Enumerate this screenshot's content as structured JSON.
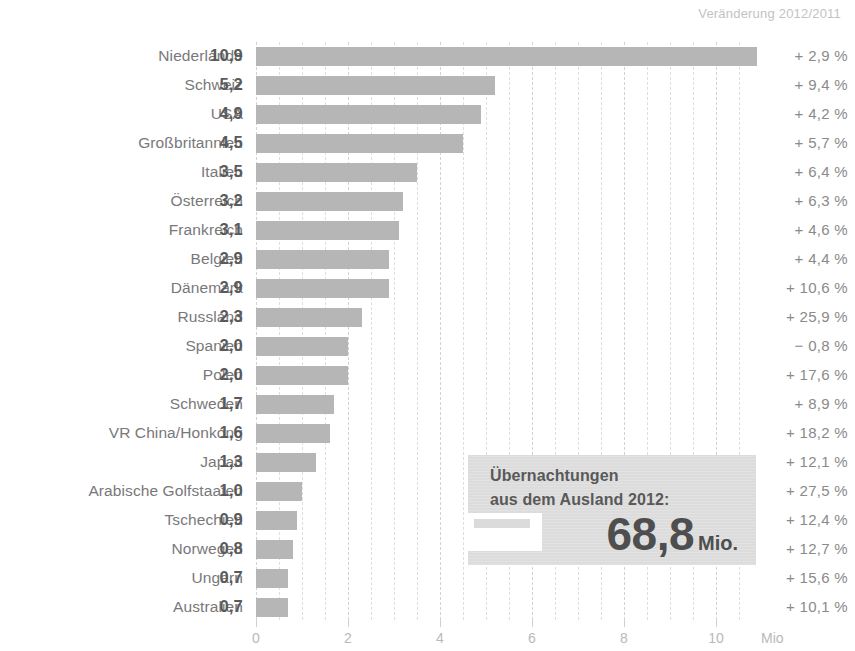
{
  "header": {
    "change_column_title": "Veränderung 2012/2011"
  },
  "axis": {
    "unit_label": "Mio",
    "ticks": [
      "0",
      "2",
      "4",
      "6",
      "8",
      "10"
    ]
  },
  "callout": {
    "line1": "Übernachtungen",
    "line2": "aus dem Ausland 2012:",
    "value": "68,8",
    "unit": "Mio."
  },
  "chart_data": {
    "type": "bar",
    "orientation": "horizontal",
    "title": "",
    "subtitle": "",
    "xlabel": "Mio",
    "ylabel": "",
    "xlim": [
      0,
      11
    ],
    "grid": true,
    "grid_step": 0.5,
    "tick_step": 2,
    "legend": "none",
    "value_label_format": "german-decimal-comma",
    "categories": [
      "Niederlande",
      "Schweiz",
      "USA",
      "Großbritannien",
      "Italien",
      "Österreich",
      "Frankreich",
      "Belgien",
      "Dänemark",
      "Russland",
      "Spanien",
      "Polen",
      "Schweden",
      "VR China/Honkong",
      "Japan",
      "Arabische Golfstaaten",
      "Tschechien",
      "Norwegen",
      "Ungarn",
      "Australien"
    ],
    "values": [
      10.9,
      5.2,
      4.9,
      4.5,
      3.5,
      3.2,
      3.1,
      2.9,
      2.9,
      2.3,
      2.0,
      2.0,
      1.7,
      1.6,
      1.3,
      1.0,
      0.9,
      0.8,
      0.7,
      0.7
    ],
    "value_labels": [
      "10,9",
      "5,2",
      "4,9",
      "4,5",
      "3,5",
      "3,2",
      "3,1",
      "2,9",
      "2,9",
      "2,3",
      "2,0",
      "2,0",
      "1,7",
      "1,6",
      "1,3",
      "1,0",
      "0,9",
      "0,8",
      "0,7",
      "0,7"
    ],
    "change_labels": [
      "+ 2,9 %",
      "+ 9,4 %",
      "+ 4,2 %",
      "+ 5,7 %",
      "+ 6,4 %",
      "+ 6,3 %",
      "+ 4,6 %",
      "+ 4,4 %",
      "+ 10,6 %",
      "+ 25,9 %",
      "− 0,8 %",
      "+ 17,6 %",
      "+ 8,9 %",
      "+ 18,2 %",
      "+ 12,1 %",
      "+ 27,5 %",
      "+ 12,4 %",
      "+ 12,7 %",
      "+ 15,6 %",
      "+ 10,1 %"
    ],
    "change_values": [
      2.9,
      9.4,
      4.2,
      5.7,
      6.4,
      6.3,
      4.6,
      4.4,
      10.6,
      25.9,
      -0.8,
      17.6,
      8.9,
      18.2,
      12.1,
      27.5,
      12.4,
      12.7,
      15.6,
      10.1
    ],
    "annotation": {
      "text": "Übernachtungen aus dem Ausland 2012: 68,8 Mio.",
      "value": 68.8,
      "unit": "Mio."
    },
    "colors": {
      "bar": "#b6b6b6",
      "callout_bg": "#dcdcdc",
      "text": "#6b6b6b",
      "grid": "#dedede"
    }
  }
}
